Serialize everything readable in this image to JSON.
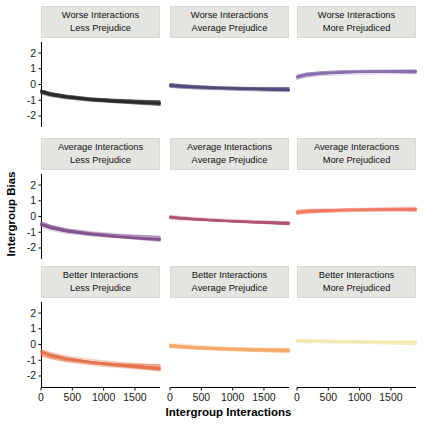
{
  "chart_data": {
    "type": "line",
    "title": "",
    "xlabel": "Intergroup Interactions",
    "ylabel": "Intergroup Bias",
    "x_ticks": [
      0,
      500,
      1000,
      1500
    ],
    "y_ticks": [
      2,
      1,
      0,
      -1,
      -2
    ],
    "x_range": [
      0,
      1900
    ],
    "y_range": [
      -2.7,
      2.7
    ],
    "grid": false,
    "legend": "none",
    "facet_rows": [
      "Worse Interactions",
      "Average Interactions",
      "Better Interactions"
    ],
    "facet_cols": [
      "Less Prejudice",
      "Average Prejudice",
      "More Prejudiced"
    ],
    "x": [
      0,
      150,
      400,
      800,
      1200,
      1600,
      1900
    ],
    "facets": [
      {
        "row_label": "Worse Interactions",
        "col_label": "Less Prejudice",
        "color": "#2a2a2a",
        "y": [
          -0.45,
          -0.62,
          -0.78,
          -0.95,
          -1.05,
          -1.13,
          -1.18
        ],
        "band": 0.35
      },
      {
        "row_label": "Worse Interactions",
        "col_label": "Average Prejudice",
        "color": "#544a7a",
        "y": [
          -0.05,
          -0.1,
          -0.16,
          -0.22,
          -0.27,
          -0.31,
          -0.33
        ],
        "band": 0.3
      },
      {
        "row_label": "Worse Interactions",
        "col_label": "More Prejudiced",
        "color": "#8c6fae",
        "y": [
          0.45,
          0.6,
          0.7,
          0.77,
          0.8,
          0.81,
          0.81
        ],
        "band": 0.28
      },
      {
        "row_label": "Average Interactions",
        "col_label": "Less Prejudice",
        "color": "#83538f",
        "y": [
          -0.5,
          -0.7,
          -0.92,
          -1.12,
          -1.27,
          -1.38,
          -1.45
        ],
        "band": 0.42
      },
      {
        "row_label": "Average Interactions",
        "col_label": "Average Prejudice",
        "color": "#b05578",
        "y": [
          -0.05,
          -0.11,
          -0.18,
          -0.27,
          -0.34,
          -0.4,
          -0.44
        ],
        "band": 0.25
      },
      {
        "row_label": "Average Interactions",
        "col_label": "More Prejudiced",
        "color": "#f07a64",
        "y": [
          0.28,
          0.34,
          0.38,
          0.42,
          0.44,
          0.45,
          0.45
        ],
        "band": 0.3
      },
      {
        "row_label": "Better Interactions",
        "col_label": "Less Prejudice",
        "color": "#e4734b",
        "y": [
          -0.5,
          -0.7,
          -0.92,
          -1.13,
          -1.28,
          -1.4,
          -1.48
        ],
        "band": 0.45
      },
      {
        "row_label": "Better Interactions",
        "col_label": "Average Prejudice",
        "color": "#f4a967",
        "y": [
          -0.05,
          -0.1,
          -0.17,
          -0.25,
          -0.31,
          -0.36,
          -0.39
        ],
        "band": 0.32
      },
      {
        "row_label": "Better Interactions",
        "col_label": "More Prejudiced",
        "color": "#f3e9ae",
        "y": [
          0.22,
          0.21,
          0.19,
          0.17,
          0.15,
          0.13,
          0.12
        ],
        "band": 0.32
      }
    ],
    "style": {
      "strip_bg": "#e4e4e1",
      "axis_color": "#000000",
      "text_color": "#1a1a1a",
      "panel_bg": "#ffffff"
    }
  }
}
